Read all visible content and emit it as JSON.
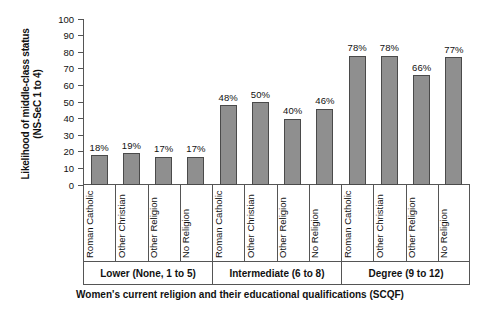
{
  "chart_data": {
    "type": "bar",
    "title": "",
    "ylabel": "Likelihood of middle-class status (NS-SeC 1 to 4)",
    "ylabel_line1": "Likelihood of middle-class status",
    "ylabel_line2": "(NS-SeC 1 to 4)",
    "xlabel": "Women's current religion and their educational qualifications (SCQF)",
    "ylim": [
      0,
      100
    ],
    "yticks": [
      100,
      90,
      80,
      70,
      60,
      50,
      40,
      30,
      20,
      10,
      0
    ],
    "grid": false,
    "legend": "none",
    "bar_color": "#8f8f8f",
    "bar_edge_color": "#4a4a4a",
    "axis_color": "#555555",
    "categories": [
      "Roman Catholic",
      "Other Christian",
      "Other Religion",
      "No Religion",
      "Roman Catholic",
      "Other Christian",
      "Other Religion",
      "No Religion",
      "Roman Catholic",
      "Other Christian",
      "Other Religion",
      "No Religion"
    ],
    "values": [
      18,
      19,
      17,
      17,
      48,
      50,
      40,
      46,
      78,
      78,
      66,
      77
    ],
    "value_labels": [
      "18%",
      "19%",
      "17%",
      "17%",
      "48%",
      "50%",
      "40%",
      "46%",
      "78%",
      "78%",
      "66%",
      "77%"
    ],
    "groups": [
      {
        "label": "Lower (None, 1 to 5)",
        "size": 4
      },
      {
        "label": "Intermediate (6 to 8)",
        "size": 4
      },
      {
        "label": "Degree (9 to 12)",
        "size": 4
      }
    ]
  }
}
